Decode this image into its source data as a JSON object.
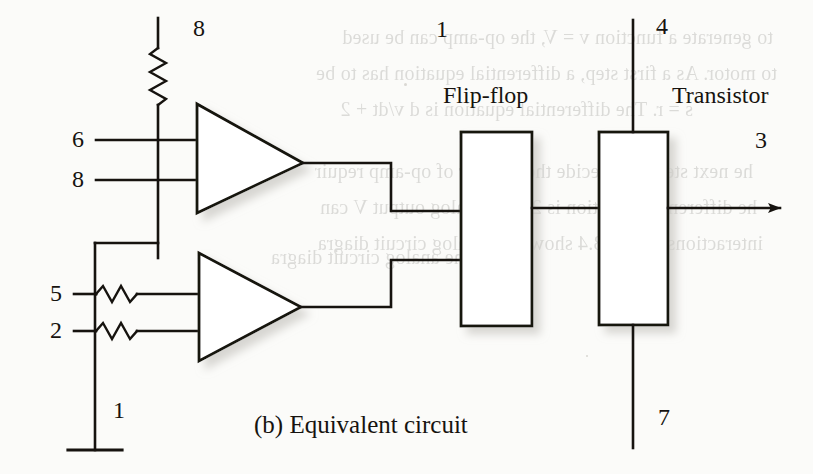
{
  "figure": {
    "caption": "(b) Equivalent circuit",
    "blocks": [
      {
        "id": "flip-flop",
        "label": "Flip-flop"
      },
      {
        "id": "transistor",
        "label": "Transistor"
      }
    ],
    "pin_labels": [
      {
        "id": "pin-8-top",
        "text": "8"
      },
      {
        "id": "pin-6",
        "text": "6"
      },
      {
        "id": "pin-8-inv",
        "text": "8"
      },
      {
        "id": "pin-5",
        "text": "5"
      },
      {
        "id": "pin-2",
        "text": "2"
      },
      {
        "id": "pin-1-ground",
        "text": "1"
      },
      {
        "id": "pin-1-ff",
        "text": "1"
      },
      {
        "id": "pin-4",
        "text": "4"
      },
      {
        "id": "pin-3",
        "text": "3"
      },
      {
        "id": "pin-7",
        "text": "7"
      }
    ],
    "components": [
      {
        "id": "resistor-supply",
        "type": "resistor",
        "orientation": "vertical"
      },
      {
        "id": "resistor-input-5",
        "type": "resistor",
        "orientation": "horizontal"
      },
      {
        "id": "resistor-input-2",
        "type": "resistor",
        "orientation": "horizontal"
      },
      {
        "id": "opamp-upper",
        "type": "op-amp"
      },
      {
        "id": "opamp-lower",
        "type": "op-amp"
      },
      {
        "id": "ground-symbol",
        "type": "ground"
      },
      {
        "id": "output-arrow",
        "type": "arrow"
      }
    ],
    "colors": {
      "ink": "#16130f",
      "paper": "#fbfbf9",
      "shadow": "#9a978f",
      "bleed": "#3c3a35"
    }
  },
  "bleed_through": {
    "lines": [
      "to generate a function v = V, the op-amp can be used",
      "to motor. As a first step, a differential equation has to be",
      "s = r. The differential equation is d v/dt + 2",
      "he next step is to decide the number of op-amp requir",
      "he differential equation is 2. The analog output V can",
      "interactions Figure 3.4 shows the analog circuit diagra",
      "s the analog circuit diagra"
    ]
  }
}
